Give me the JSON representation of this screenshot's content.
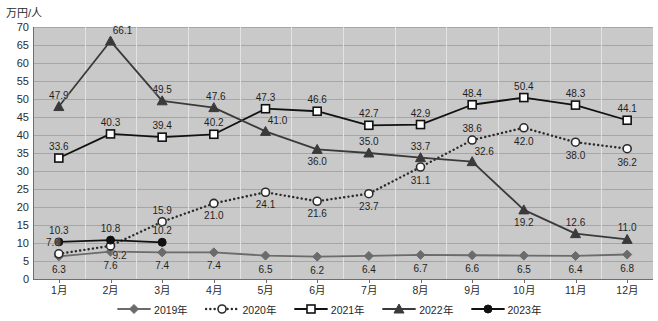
{
  "chart_data": {
    "type": "line",
    "title": "",
    "ylabel": "万円/人",
    "xlabel": "",
    "ylim": [
      0,
      70
    ],
    "ytick_step": 5,
    "grid": "horizontal-and-vertical",
    "legend_position": "bottom",
    "categories": [
      "1月",
      "2月",
      "3月",
      "4月",
      "5月",
      "6月",
      "7月",
      "8月",
      "9月",
      "10月",
      "11月",
      "12月"
    ],
    "yticks": [
      "0",
      "5",
      "10",
      "15",
      "20",
      "25",
      "30",
      "35",
      "40",
      "45",
      "50",
      "55",
      "60",
      "65",
      "70"
    ],
    "series": [
      {
        "name": "2019年",
        "marker": "diamond-filled",
        "line": "solid",
        "color": "#6b6b6b",
        "values": [
          6.3,
          7.6,
          7.4,
          7.4,
          6.5,
          6.2,
          6.4,
          6.7,
          6.6,
          6.5,
          6.4,
          6.8
        ],
        "labels": [
          "6.3",
          "7.6",
          "7.4",
          "7.4",
          "6.5",
          "6.2",
          "6.4",
          "6.7",
          "6.6",
          "6.5",
          "6.4",
          "6.8"
        ],
        "label_position": "below"
      },
      {
        "name": "2020年",
        "marker": "circle-open",
        "line": "dotted",
        "color": "#2b2b2b",
        "values": [
          7.0,
          9.2,
          15.9,
          21.0,
          24.1,
          21.6,
          23.7,
          31.1,
          38.6,
          42.0,
          38.0,
          36.2
        ],
        "labels": [
          "7.0",
          "9.2",
          "15.9",
          "21.0",
          "24.1",
          "21.6",
          "23.7",
          "31.1",
          "38.6",
          "42.0",
          "38.0",
          "36.2"
        ],
        "label_position": "mixed"
      },
      {
        "name": "2021年",
        "marker": "square-open",
        "line": "solid",
        "color": "#111111",
        "values": [
          33.6,
          40.3,
          39.4,
          40.2,
          47.3,
          46.6,
          42.7,
          42.9,
          48.4,
          50.4,
          48.3,
          44.1
        ],
        "labels": [
          "33.6",
          "40.3",
          "39.4",
          "40.2",
          "47.3",
          "46.6",
          "42.7",
          "42.9",
          "48.4",
          "50.4",
          "48.3",
          "44.1"
        ],
        "label_position": "above"
      },
      {
        "name": "2022年",
        "marker": "triangle-filled",
        "line": "solid",
        "color": "#3a3a3a",
        "values": [
          47.9,
          66.1,
          49.5,
          47.6,
          41.0,
          36.0,
          35.0,
          33.7,
          32.6,
          19.2,
          12.6,
          11.0
        ],
        "labels": [
          "47.9",
          "66.1",
          "49.5",
          "47.6",
          "41.0",
          "36.0",
          "35.0",
          "33.7",
          "32.6",
          "19.2",
          "12.6",
          "11.0"
        ],
        "label_position": "mixed"
      },
      {
        "name": "2023年",
        "marker": "circle-filled",
        "line": "solid",
        "color": "#111111",
        "values": [
          10.3,
          10.8,
          10.2,
          null,
          null,
          null,
          null,
          null,
          null,
          null,
          null,
          null
        ],
        "labels": [
          "10.3",
          "10.8",
          "10.2",
          "",
          "",
          "",
          "",
          "",
          "",
          "",
          "",
          ""
        ],
        "label_position": "above"
      }
    ]
  },
  "legend": {
    "items": [
      {
        "label": "2019年",
        "marker": "diamond-filled",
        "line": "solid"
      },
      {
        "label": "2020年",
        "marker": "circle-open",
        "line": "dotted"
      },
      {
        "label": "2021年",
        "marker": "square-open",
        "line": "solid"
      },
      {
        "label": "2022年",
        "marker": "triangle-filled",
        "line": "solid"
      },
      {
        "label": "2023年",
        "marker": "circle-filled",
        "line": "solid"
      }
    ]
  },
  "colors": {
    "plot_background": "#c9c9c9",
    "hgrid": "#a6a6a6",
    "vgrid": "#e2e2e2",
    "axis": "#6e6e6e",
    "text": "#1f1f1f"
  }
}
